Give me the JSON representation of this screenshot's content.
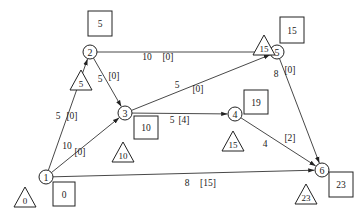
{
  "diagram": {
    "type": "network-activity-graph",
    "nodes": [
      {
        "id": "1",
        "label": "1",
        "early_time": "0",
        "late_time": "0"
      },
      {
        "id": "2",
        "label": "2",
        "early_time": "5",
        "late_time": "5"
      },
      {
        "id": "3",
        "label": "3",
        "early_time": "10",
        "late_time": "10"
      },
      {
        "id": "4",
        "label": "4",
        "early_time": "15",
        "late_time": "19"
      },
      {
        "id": "5",
        "label": "5",
        "early_time": "15",
        "late_time": "15"
      },
      {
        "id": "6",
        "label": "6",
        "early_time": "23",
        "late_time": "23"
      }
    ],
    "edges": [
      {
        "from": "1",
        "to": "2",
        "duration": "5",
        "slack": "[0]"
      },
      {
        "from": "1",
        "to": "3",
        "duration": "10",
        "slack": "[0]"
      },
      {
        "from": "1",
        "to": "6",
        "duration": "8",
        "slack": "[15]"
      },
      {
        "from": "2",
        "to": "5",
        "duration": "10",
        "slack": "[0]"
      },
      {
        "from": "2",
        "to": "3",
        "duration": "5",
        "slack": "[0]"
      },
      {
        "from": "3",
        "to": "5",
        "duration": "5",
        "slack": "[0]"
      },
      {
        "from": "3",
        "to": "4",
        "duration": "5",
        "slack": "[4]"
      },
      {
        "from": "4",
        "to": "6",
        "duration": "4",
        "slack": "[2]"
      },
      {
        "from": "5",
        "to": "6",
        "duration": "8",
        "slack": "[0]"
      }
    ],
    "legend": {
      "triangle": "early event time",
      "square": "late event time"
    }
  }
}
